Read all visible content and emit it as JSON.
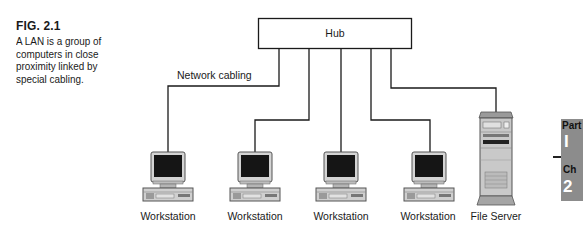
{
  "figure": {
    "number": "FIG. 2.1",
    "caption": "A LAN is a group of computers in close proximity linked by special cabling."
  },
  "diagram": {
    "hub_label": "Hub",
    "cabling_label": "Network cabling",
    "nodes": [
      {
        "label": "Workstation",
        "type": "workstation"
      },
      {
        "label": "Workstation",
        "type": "workstation"
      },
      {
        "label": "Workstation",
        "type": "workstation"
      },
      {
        "label": "Workstation",
        "type": "workstation"
      },
      {
        "label": "File Server",
        "type": "file-server"
      }
    ]
  },
  "side_tab": {
    "part_label": "Part",
    "part_number": "I",
    "chapter_label": "Ch",
    "chapter_number": "2"
  },
  "colors": {
    "line": "#1a1a1a",
    "screen": "#111111",
    "device_gray": "#c8c8c8",
    "tab_gray": "#8c8c8c"
  }
}
